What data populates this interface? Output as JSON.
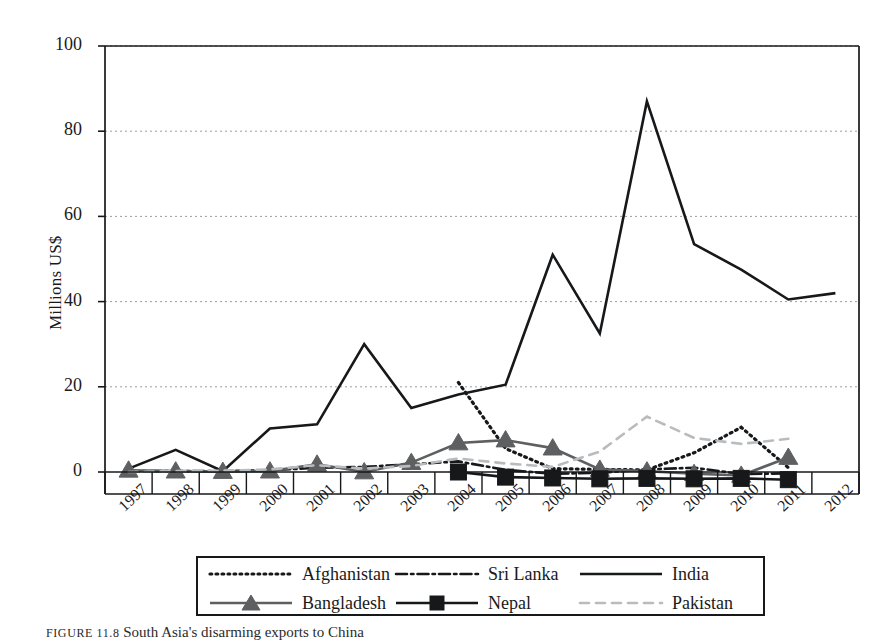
{
  "chart_data": {
    "type": "line",
    "title": "",
    "xlabel": "",
    "ylabel": "Millions US$",
    "ylim": [
      -5,
      100
    ],
    "yticks": [
      0,
      20,
      40,
      60,
      80,
      100
    ],
    "grid": "horizontal-dotted",
    "legend_position": "bottom",
    "categories": [
      "1997",
      "1998",
      "1999",
      "2000",
      "2001",
      "2002",
      "2003",
      "2004",
      "2005",
      "2006",
      "2007",
      "2008",
      "2009",
      "2010",
      "2011",
      "2012"
    ],
    "series": [
      {
        "name": "Afghanistan",
        "style": "dotted",
        "color": "#16181a",
        "marker": "none",
        "values": [
          null,
          null,
          null,
          null,
          null,
          null,
          null,
          21.0,
          5.5,
          0.8,
          0.6,
          0.5,
          4.5,
          10.5,
          1.0,
          null
        ]
      },
      {
        "name": "Sri Lanka",
        "style": "dash-dot",
        "color": "#16181a",
        "marker": "none",
        "values": [
          0.2,
          0.2,
          0.2,
          0.4,
          1.0,
          1.2,
          1.8,
          2.5,
          0.5,
          -0.4,
          -0.2,
          0.6,
          1.0,
          -0.5,
          -0.3,
          null
        ]
      },
      {
        "name": "India",
        "style": "solid",
        "color": "#16181a",
        "marker": "none",
        "values": [
          0.8,
          5.2,
          0.2,
          10.2,
          11.2,
          30.0,
          15.0,
          18.2,
          20.5,
          51.0,
          32.5,
          87.0,
          53.5,
          47.5,
          40.5,
          42.0
        ]
      },
      {
        "name": "Bangladesh",
        "style": "solid",
        "color": "#5d5f61",
        "marker": "triangle",
        "values": [
          0.4,
          0.2,
          0.1,
          0.2,
          1.8,
          0.0,
          2.2,
          6.8,
          7.5,
          5.6,
          0.6,
          0.2,
          -0.4,
          -0.8,
          3.4,
          null
        ]
      },
      {
        "name": "Nepal",
        "style": "solid",
        "color": "#16181a",
        "marker": "square",
        "values": [
          null,
          null,
          null,
          null,
          null,
          null,
          null,
          0.0,
          -1.2,
          -1.4,
          -1.6,
          -1.5,
          -1.6,
          -1.5,
          -1.8,
          null
        ]
      },
      {
        "name": "Pakistan",
        "style": "dashed",
        "color": "#b9bcbe",
        "marker": "none",
        "values": [
          0.0,
          0.2,
          0.3,
          0.6,
          1.6,
          0.8,
          1.4,
          3.2,
          2.0,
          1.2,
          4.8,
          13.0,
          8.0,
          6.6,
          7.8,
          null
        ]
      }
    ]
  },
  "legend": {
    "rows": [
      [
        {
          "label": "Afghanistan",
          "series": "Afghanistan"
        },
        {
          "label": "Sri Lanka",
          "series": "Sri Lanka"
        },
        {
          "label": "India",
          "series": "India"
        }
      ],
      [
        {
          "label": "Bangladesh",
          "series": "Bangladesh"
        },
        {
          "label": "Nepal",
          "series": "Nepal"
        },
        {
          "label": "Pakistan",
          "series": "Pakistan"
        }
      ]
    ]
  },
  "caption": {
    "figure_number": "FIGURE 11.8",
    "text": "South Asia's disarming exports to China"
  },
  "colors": {
    "axis": "#16181a",
    "grid": "#9b9da0",
    "india": "#16181a",
    "bangladesh": "#5d5f61",
    "pakistan": "#b9bcbe"
  }
}
